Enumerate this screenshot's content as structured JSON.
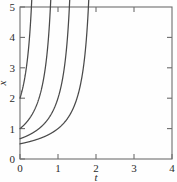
{
  "chart_data": {
    "type": "line",
    "title": "",
    "subtitle": "",
    "xlabel": "t",
    "ylabel": "x",
    "xlim": [
      0,
      4
    ],
    "ylim": [
      0,
      5
    ],
    "xticks": [
      0,
      1,
      2,
      3,
      4
    ],
    "xtick_labels": [
      "0",
      "1",
      "2",
      "3",
      "4"
    ],
    "yticks": [
      0,
      1,
      2,
      3,
      4,
      5
    ],
    "ytick_labels": [
      "0",
      "1",
      "2",
      "3",
      "4",
      "5"
    ],
    "grid": false,
    "legend": "none",
    "line_color": "#4a4a4a",
    "axis_color": "#6d6d6d",
    "background_color": "#fefefe",
    "series": [
      {
        "name": "curve-1",
        "initial_value": 2.0,
        "x": [
          0,
          0.1,
          0.2,
          0.3,
          0.35,
          0.4,
          0.42,
          0.44,
          0.46,
          0.48,
          0.49
        ],
        "values": [
          2.0,
          2.5,
          3.33,
          5.0,
          6.67,
          10.0,
          12.5,
          16.67,
          25.0,
          50.0,
          100.0
        ]
      },
      {
        "name": "curve-2",
        "initial_value": 1.0,
        "x": [
          0,
          0.2,
          0.4,
          0.5,
          0.6,
          0.7,
          0.75,
          0.8,
          0.85,
          0.9,
          0.95,
          0.98
        ],
        "values": [
          1.0,
          1.25,
          1.67,
          2.0,
          2.5,
          3.33,
          4.0,
          5.0,
          6.67,
          10.0,
          20.0,
          50.0
        ]
      },
      {
        "name": "curve-3",
        "initial_value": 0.667,
        "x": [
          0,
          0.3,
          0.6,
          0.9,
          1.05,
          1.2,
          1.3,
          1.35,
          1.4,
          1.45,
          1.48
        ],
        "values": [
          0.667,
          0.83,
          1.11,
          1.67,
          2.11,
          2.86,
          3.7,
          4.35,
          5.26,
          7.14,
          10.0
        ]
      },
      {
        "name": "curve-4",
        "initial_value": 0.5,
        "x": [
          0,
          0.4,
          0.8,
          1.2,
          1.5,
          1.7,
          1.8,
          1.9,
          1.95,
          1.98
        ],
        "values": [
          0.5,
          0.625,
          0.83,
          1.25,
          1.6,
          2.0,
          2.5,
          3.33,
          5.0,
          10.0
        ]
      }
    ]
  },
  "axis": {
    "y_title": "x",
    "x_title": "t"
  }
}
